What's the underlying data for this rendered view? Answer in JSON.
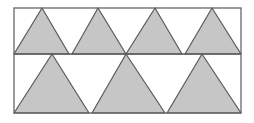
{
  "diagram": {
    "colors": {
      "fill": "#c6c6c6",
      "stroke": "#5a5a5a",
      "background": "#ffffff"
    },
    "rectangle": {
      "x": 14,
      "y": 8,
      "width": 227,
      "height": 105
    },
    "divider_y": 54,
    "rows": [
      {
        "name": "top-row",
        "triangle_count": 4,
        "triangles": [
          {
            "left": 14,
            "right": 69,
            "apex_x": 42,
            "top": 8,
            "base": 54
          },
          {
            "left": 72,
            "right": 126,
            "apex_x": 98,
            "top": 8,
            "base": 54
          },
          {
            "left": 126,
            "right": 182,
            "apex_x": 155,
            "top": 8,
            "base": 54
          },
          {
            "left": 185,
            "right": 241,
            "apex_x": 212,
            "top": 8,
            "base": 54
          }
        ]
      },
      {
        "name": "bottom-row",
        "triangle_count": 3,
        "triangles": [
          {
            "left": 14,
            "right": 89,
            "apex_x": 52,
            "top": 54,
            "base": 113
          },
          {
            "left": 92,
            "right": 165,
            "apex_x": 126,
            "top": 54,
            "base": 113
          },
          {
            "left": 167,
            "right": 241,
            "apex_x": 202,
            "top": 54,
            "base": 113
          }
        ]
      }
    ]
  }
}
